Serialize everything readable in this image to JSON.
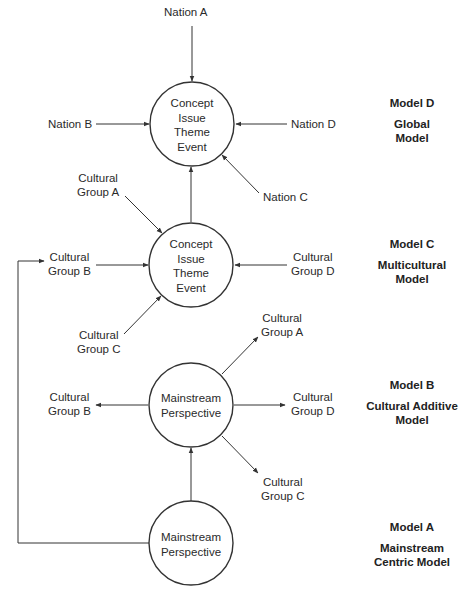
{
  "diagram": {
    "models": [
      {
        "id": "D",
        "name": "Model D",
        "description_lines": [
          "Global",
          "Model"
        ],
        "center_lines": [
          "Concept",
          "Issue",
          "Theme",
          "Event"
        ],
        "inputs": {
          "top": [
            "Nation A"
          ],
          "left": [
            "Nation B"
          ],
          "right": [
            "Nation D"
          ],
          "bottom_right": [
            "Nation C"
          ]
        }
      },
      {
        "id": "C",
        "name": "Model C",
        "description_lines": [
          "Multicultural",
          "Model"
        ],
        "center_lines": [
          "Concept",
          "Issue",
          "Theme",
          "Event"
        ],
        "inputs": {
          "top_left": [
            "Cultural",
            "Group A"
          ],
          "left": [
            "Cultural",
            "Group B"
          ],
          "right": [
            "Cultural",
            "Group D"
          ],
          "bottom_left": [
            "Cultural",
            "Group C"
          ]
        }
      },
      {
        "id": "B",
        "name": "Model B",
        "description_lines": [
          "Cultural Additive",
          "Model"
        ],
        "center_lines": [
          "Mainstream",
          "Perspective"
        ],
        "outputs": {
          "top_right": [
            "Cultural",
            "Group A"
          ],
          "left": [
            "Cultural",
            "Group B"
          ],
          "right": [
            "Cultural",
            "Group D"
          ],
          "bottom_right": [
            "Cultural",
            "Group C"
          ]
        }
      },
      {
        "id": "A",
        "name": "Model A",
        "description_lines": [
          "Mainstream",
          "Centric Model"
        ],
        "center_lines": [
          "Mainstream",
          "Perspective"
        ]
      }
    ],
    "colors": {
      "line": "#333333",
      "text": "#2a2a2a",
      "background": "#ffffff"
    }
  }
}
